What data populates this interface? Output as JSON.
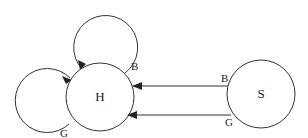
{
  "diagram": {
    "type": "state-diagram",
    "nodes": [
      {
        "id": "H",
        "label": "H"
      },
      {
        "id": "S",
        "label": "S"
      }
    ],
    "edges": [
      {
        "from": "H",
        "to": "H",
        "label": "B",
        "kind": "self-loop-top"
      },
      {
        "from": "H",
        "to": "H",
        "label": "G",
        "kind": "self-loop-left"
      },
      {
        "from": "S",
        "to": "H",
        "label": "B"
      },
      {
        "from": "S",
        "to": "H",
        "label": "G"
      }
    ]
  },
  "labels": {
    "node_h": "H",
    "node_s": "S",
    "loop_top": "B",
    "loop_left": "G",
    "edge_s_h_upper": "B",
    "edge_s_h_lower": "G"
  },
  "colors": {
    "stroke": "#333333",
    "background": "#ffffff"
  }
}
